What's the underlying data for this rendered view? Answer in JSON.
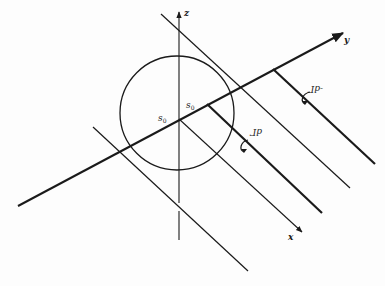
{
  "diagram": {
    "type": "3d-coordinate-sketch",
    "axes": {
      "z": {
        "label": "z"
      },
      "y": {
        "label": "y"
      },
      "x": {
        "label": "x"
      }
    },
    "points": {
      "s0_left": {
        "label": "s",
        "sub": "0"
      },
      "s0_right": {
        "label": "s",
        "sub": "0"
      }
    },
    "annotations": {
      "dGamma": "dΓ",
      "neg_dGamma": "-dΓ"
    },
    "colors": {
      "stroke": "#1a1a1a",
      "background": "#fdfdfd"
    }
  }
}
